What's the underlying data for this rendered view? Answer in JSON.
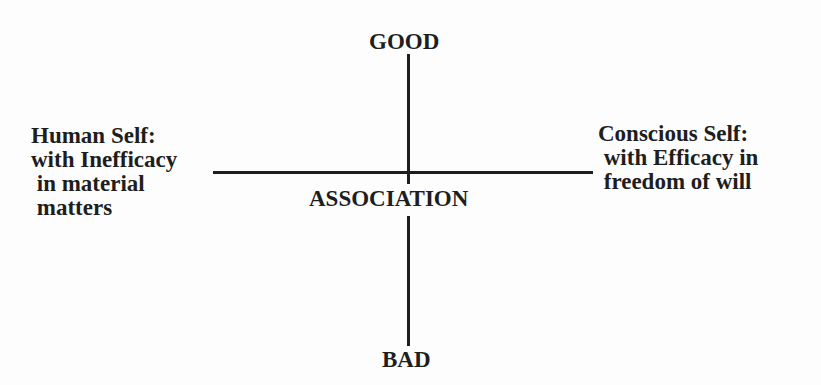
{
  "diagram": {
    "top_label": "GOOD",
    "bottom_label": "BAD",
    "center_label": "ASSOCIATION",
    "left_label": {
      "lines": [
        "Human Self:",
        "with Inefficacy",
        " in material",
        " matters"
      ]
    },
    "right_label": {
      "lines": [
        "Conscious Self:",
        " with Efficacy in",
        " freedom of will"
      ]
    },
    "axes": {
      "vertical": "GOOD to BAD",
      "horizontal": "Human Self to Conscious Self"
    }
  }
}
